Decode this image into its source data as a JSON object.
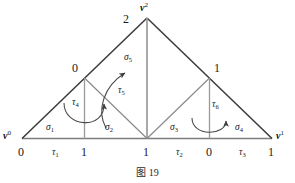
{
  "figure": {
    "caption": "图 19",
    "colors": {
      "outline": "#3a3a3a",
      "interior_edge": "#8a8a8a",
      "baseline": "#7a7a7a",
      "arrow": "#555555",
      "text": "#1a1a1a",
      "background": "#ffffff"
    },
    "vertices": {
      "apex_number": "2",
      "apex_vector": "v",
      "apex_vector_sup": "2",
      "left_vector": "v",
      "left_vector_sup": "0",
      "right_vector": "v",
      "right_vector_sup": "1",
      "mid_left_number": "0",
      "mid_right_number": "1"
    },
    "baseline_labels": [
      {
        "name": "base-0-left",
        "text": "0"
      },
      {
        "name": "base-tau-1",
        "symbol": "τ",
        "subscript": "1"
      },
      {
        "name": "base-1-left",
        "text": "1"
      },
      {
        "name": "base-1-center",
        "text": "1"
      },
      {
        "name": "base-tau-2",
        "symbol": "τ",
        "subscript": "2"
      },
      {
        "name": "base-0-right",
        "text": "0"
      },
      {
        "name": "base-tau-3",
        "symbol": "τ",
        "subscript": "3"
      },
      {
        "name": "base-1-right",
        "text": "1"
      }
    ],
    "simplices": [
      {
        "name": "sigma-1",
        "symbol": "σ",
        "subscript": "1"
      },
      {
        "name": "sigma-2",
        "symbol": "σ",
        "subscript": "2"
      },
      {
        "name": "sigma-3",
        "symbol": "σ",
        "subscript": "3"
      },
      {
        "name": "sigma-4",
        "symbol": "σ",
        "subscript": "4"
      },
      {
        "name": "sigma-5",
        "symbol": "σ",
        "subscript": "5"
      }
    ],
    "edge_maps": [
      {
        "name": "tau-4",
        "symbol": "τ",
        "subscript": "4"
      },
      {
        "name": "tau-5",
        "symbol": "τ",
        "subscript": "5"
      },
      {
        "name": "tau-6",
        "symbol": "τ",
        "subscript": "6"
      }
    ]
  }
}
